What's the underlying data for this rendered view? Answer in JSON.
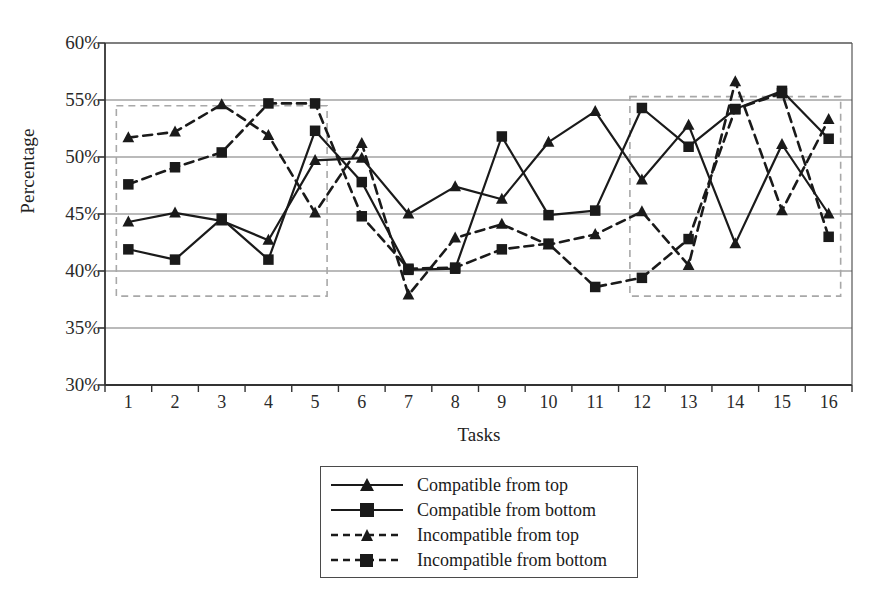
{
  "chart_data": {
    "type": "line",
    "title": "",
    "xlabel": "Tasks",
    "ylabel": "Percentage",
    "categories": [
      "1",
      "2",
      "3",
      "4",
      "5",
      "6",
      "7",
      "8",
      "9",
      "10",
      "11",
      "12",
      "13",
      "14",
      "15",
      "16"
    ],
    "x": [
      1,
      2,
      3,
      4,
      5,
      6,
      7,
      8,
      9,
      10,
      11,
      12,
      13,
      14,
      15,
      16
    ],
    "ylim": [
      30,
      60
    ],
    "ytick_values": [
      60,
      55,
      50,
      45,
      40,
      35,
      30
    ],
    "ytick_labels": [
      "60%",
      "55%",
      "50%",
      "45%",
      "40%",
      "35%",
      "30%"
    ],
    "grid": "horizontal",
    "legend_position": "bottom-center",
    "series": [
      {
        "name": "Compatible from top",
        "marker": "triangle",
        "line_style": "solid",
        "color": "#1a1a1a",
        "values": [
          44.3,
          45.1,
          44.4,
          42.7,
          49.7,
          49.9,
          45.0,
          47.4,
          46.3,
          51.3,
          54.0,
          48.0,
          52.8,
          42.4,
          51.1,
          45.0
        ]
      },
      {
        "name": "Compatible from bottom",
        "marker": "square",
        "line_style": "solid",
        "color": "#1a1a1a",
        "values": [
          41.9,
          41.0,
          44.6,
          41.0,
          52.3,
          47.8,
          40.1,
          40.2,
          51.8,
          44.9,
          45.3,
          54.3,
          50.9,
          54.2,
          55.8,
          51.6
        ]
      },
      {
        "name": "Incompatible from top",
        "marker": "triangle",
        "line_style": "dashed",
        "color": "#1a1a1a",
        "values": [
          51.7,
          52.2,
          54.6,
          51.9,
          45.1,
          51.2,
          37.9,
          42.9,
          44.1,
          42.3,
          43.2,
          45.2,
          40.5,
          56.6,
          45.3,
          53.3
        ]
      },
      {
        "name": "Incompatible from bottom",
        "marker": "square",
        "line_style": "dashed",
        "color": "#1a1a1a",
        "values": [
          47.6,
          49.1,
          50.4,
          54.7,
          54.7,
          44.8,
          40.2,
          40.3,
          41.9,
          42.4,
          38.6,
          39.4,
          42.8,
          54.2,
          55.6,
          43.0
        ]
      }
    ],
    "annotations": [
      {
        "type": "highlight-box",
        "name": "left-highlight-box",
        "x_range": [
          1,
          5
        ],
        "y_range": [
          37.8,
          54.5
        ],
        "style": "dashed",
        "color": "#a8a8a8"
      },
      {
        "type": "highlight-box",
        "name": "right-highlight-box",
        "x_range": [
          12,
          16
        ],
        "y_range": [
          37.8,
          55.3
        ],
        "style": "dashed",
        "color": "#a8a8a8"
      }
    ]
  },
  "legend": {
    "items": [
      {
        "label": "Compatible from top"
      },
      {
        "label": "Compatible from bottom"
      },
      {
        "label": "Incompatible from top"
      },
      {
        "label": "Incompatible from bottom"
      }
    ]
  }
}
